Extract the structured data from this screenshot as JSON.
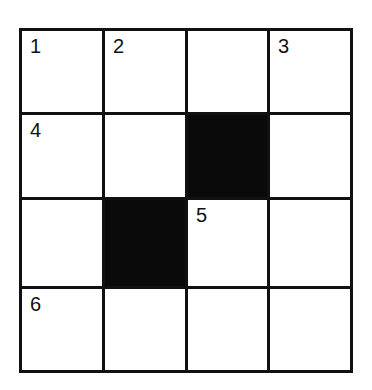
{
  "puzzle": {
    "type": "crossword",
    "rows": 4,
    "cols": 4,
    "colors": {
      "line": "#111111",
      "block": "#0a0a0a",
      "cell": "#ffffff"
    },
    "cells": [
      [
        {
          "num": "1",
          "block": false
        },
        {
          "num": "2",
          "block": false
        },
        {
          "num": "",
          "block": false
        },
        {
          "num": "3",
          "block": false
        }
      ],
      [
        {
          "num": "4",
          "block": false
        },
        {
          "num": "",
          "block": false
        },
        {
          "num": "",
          "block": true
        },
        {
          "num": "",
          "block": false
        }
      ],
      [
        {
          "num": "",
          "block": false
        },
        {
          "num": "",
          "block": true
        },
        {
          "num": "5",
          "block": false
        },
        {
          "num": "",
          "block": false
        }
      ],
      [
        {
          "num": "6",
          "block": false
        },
        {
          "num": "",
          "block": false
        },
        {
          "num": "",
          "block": false
        },
        {
          "num": "",
          "block": false
        }
      ]
    ]
  }
}
